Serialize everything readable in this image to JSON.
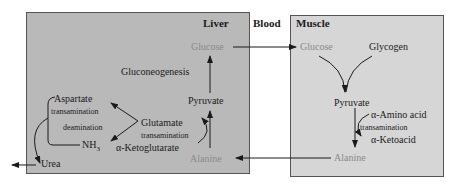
{
  "regions": {
    "liver": "Liver",
    "blood": "Blood",
    "muscle": "Muscle"
  },
  "liver": {
    "glucose": "Glucose",
    "gluconeogenesis": "Gluconeogenesis",
    "pyruvate": "Pyruvate",
    "aspartate": "Aspartate",
    "transamination_left": "transamination",
    "deamination": "deamination",
    "nh3": "NH",
    "nh3_sub": "3",
    "glutamate": "Glutamate",
    "transamination_right": "transamination",
    "ketoglutarate": "α-Ketoglutarate",
    "alanine": "Alanine",
    "urea": "Urea"
  },
  "muscle": {
    "glucose": "Glucose",
    "glycogen": "Glycogen",
    "pyruvate": "Pyruvate",
    "amino_acid": "α-Amino acid",
    "transamination": "transamination",
    "ketoacid": "α-Ketoacid",
    "alanine": "Alanine"
  },
  "colors": {
    "liver_bg": "#b9b9b9",
    "muscle_bg": "#d6d6d6",
    "highlight_text": "#8a8a8a",
    "text": "#1a1a1a"
  }
}
